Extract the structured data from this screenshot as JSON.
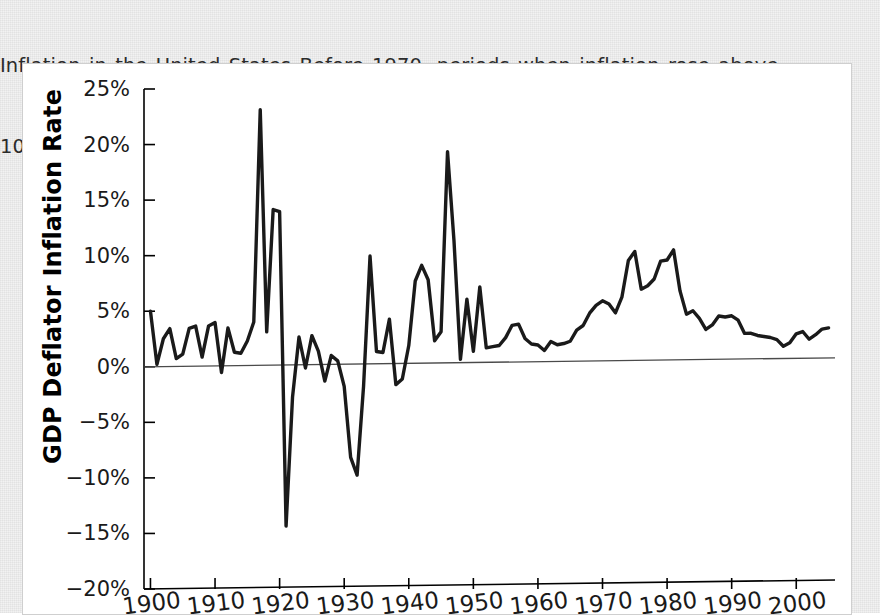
{
  "caption": {
    "line1": "Inflation in the United States Before 1970, periods when inflation rose above",
    "line2": "10 percent were confined to major wars."
  },
  "chart_data": {
    "type": "line",
    "title": "",
    "xlabel": "",
    "ylabel": "GDP Deflator Inflation Rate",
    "xlim": [
      1899,
      2006
    ],
    "ylim": [
      -20,
      25
    ],
    "grid": false,
    "legend": null,
    "yticks": [
      25,
      20,
      15,
      10,
      5,
      0,
      -5,
      -10,
      -15,
      -20
    ],
    "ytick_labels": [
      "25%",
      "20%",
      "15%",
      "10%",
      "5%",
      "0%",
      "−5%",
      "−10%",
      "−15%",
      "−20%"
    ],
    "xticks": [
      1900,
      1910,
      1920,
      1930,
      1940,
      1950,
      1960,
      1970,
      1980,
      1990,
      2000
    ],
    "xtick_labels": [
      "1900",
      "1910",
      "1920",
      "1930",
      "1940",
      "1950",
      "1960",
      "1970",
      "1980",
      "1990",
      "2000"
    ],
    "series_name": "GDP Deflator Inflation Rate",
    "line_color": "#1a1a1a",
    "zero_reference": 0,
    "x": [
      1900,
      1901,
      1902,
      1903,
      1904,
      1905,
      1906,
      1907,
      1908,
      1909,
      1910,
      1911,
      1912,
      1913,
      1914,
      1915,
      1916,
      1917,
      1918,
      1919,
      1920,
      1921,
      1922,
      1923,
      1924,
      1925,
      1926,
      1927,
      1928,
      1929,
      1930,
      1931,
      1932,
      1933,
      1934,
      1935,
      1936,
      1937,
      1938,
      1939,
      1940,
      1941,
      1942,
      1943,
      1944,
      1945,
      1946,
      1947,
      1948,
      1949,
      1950,
      1951,
      1952,
      1953,
      1954,
      1955,
      1956,
      1957,
      1958,
      1959,
      1960,
      1961,
      1962,
      1963,
      1964,
      1965,
      1966,
      1967,
      1968,
      1969,
      1970,
      1971,
      1972,
      1973,
      1974,
      1975,
      1976,
      1977,
      1978,
      1979,
      1980,
      1981,
      1982,
      1983,
      1984,
      1985,
      1986,
      1987,
      1988,
      1989,
      1990,
      1991,
      1992,
      1993,
      1994,
      1995,
      1996,
      1997,
      1998,
      1999,
      2000,
      2001,
      2002,
      2003,
      2004,
      2005
    ],
    "y": [
      5.0,
      0.2,
      2.5,
      3.4,
      0.7,
      1.1,
      3.4,
      3.6,
      0.8,
      3.6,
      3.9,
      -0.6,
      3.4,
      1.2,
      1.1,
      2.2,
      3.9,
      23.0,
      3.0,
      14.0,
      13.8,
      -14.5,
      -2.9,
      2.5,
      -0.3,
      2.6,
      1.2,
      -1.5,
      0.8,
      0.3,
      -2.0,
      -8.4,
      -10.0,
      -2.0,
      9.7,
      1.1,
      1.0,
      4.0,
      -1.9,
      -1.4,
      1.6,
      7.4,
      8.8,
      7.5,
      2.0,
      2.8,
      19.0,
      11.0,
      0.3,
      5.7,
      1.0,
      6.8,
      1.3,
      1.4,
      1.5,
      2.2,
      3.3,
      3.4,
      2.1,
      1.6,
      1.5,
      1.0,
      1.8,
      1.5,
      1.6,
      1.8,
      2.8,
      3.2,
      4.3,
      5.0,
      5.4,
      5.1,
      4.3,
      5.7,
      9.0,
      9.8,
      6.4,
      6.7,
      7.3,
      8.9,
      9.0,
      9.9,
      6.2,
      4.1,
      4.4,
      3.7,
      2.7,
      3.1,
      3.9,
      3.8,
      3.9,
      3.5,
      2.3,
      2.3,
      2.1,
      2.0,
      1.9,
      1.7,
      1.1,
      1.4,
      2.2,
      2.4,
      1.7,
      2.1,
      2.6,
      2.7
    ]
  }
}
